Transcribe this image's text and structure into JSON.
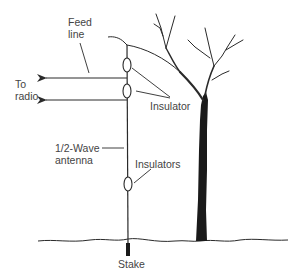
{
  "diagram": {
    "type": "antenna-installation",
    "labels": {
      "feed_line_1": "Feed",
      "feed_line_2": "line",
      "to_radio_1": "To",
      "to_radio_2": "radio",
      "insulator": "Insulator",
      "half_wave_1": "1/2-Wave",
      "half_wave_2": "antenna",
      "insulators": "Insulators",
      "stake": "Stake"
    },
    "colors": {
      "line": "#2a2a2a",
      "text": "#444444",
      "background": "#ffffff",
      "trunk": "#1a1a1a"
    }
  }
}
